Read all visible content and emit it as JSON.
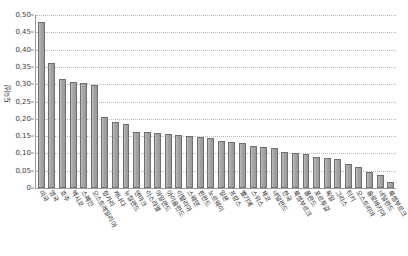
{
  "chart_data": {
    "type": "bar",
    "title": "",
    "xlabel": "",
    "ylabel": "도덕성",
    "ylim": [
      0,
      0.5
    ],
    "ytick_values": [
      0,
      0.05,
      0.1,
      0.15,
      0.2,
      0.25,
      0.3,
      0.35,
      0.4,
      0.45,
      0.5
    ],
    "ytick_labels": [
      "0",
      "0,05",
      "0,10",
      "0,15",
      "0,20",
      "0,25",
      "0,30",
      "0,35",
      "0,40",
      "0,45",
      "0,50"
    ],
    "grid": true,
    "legend": false,
    "decimal_separator": ",",
    "bar_color": "#a8a8a8",
    "bar_edge_color": "#6f6f6f",
    "gridline_color": "#b9b9b9",
    "axis_color": "#9a9a9a",
    "categories": [
      "미국",
      "영국",
      "호주",
      "멕시코",
      "스페인",
      "오스트레일리아",
      "헝가리",
      "캐나다",
      "뉴질랜드",
      "덴마크",
      "이스라엘",
      "아일랜드",
      "아이슬란드",
      "이탈리아",
      "스웨덴",
      "핀란드",
      "노르웨이",
      "일본",
      "프랑스",
      "벨기에",
      "스위스",
      "체코",
      "네덜란드",
      "한국",
      "룩셈부르크",
      "폴란드",
      "포르투갈",
      "독일",
      "그리스",
      "터키",
      "오스트리아",
      "슬로바키아",
      "네덜란드",
      "룩셈부르크"
    ],
    "values": [
      0.48,
      0.36,
      0.315,
      0.305,
      0.303,
      0.297,
      0.205,
      0.19,
      0.185,
      0.163,
      0.162,
      0.16,
      0.155,
      0.152,
      0.15,
      0.148,
      0.145,
      0.135,
      0.133,
      0.13,
      0.12,
      0.118,
      0.115,
      0.103,
      0.1,
      0.098,
      0.09,
      0.088,
      0.085,
      0.07,
      0.062,
      0.045,
      0.038,
      0.018
    ]
  }
}
